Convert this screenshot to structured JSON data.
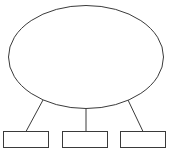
{
  "canvas": {
    "width": 194,
    "height": 151,
    "background_color": "#ffffff"
  },
  "diagram": {
    "type": "hierarchy-tree",
    "title": "",
    "stroke_color": "#3a3a3a",
    "fill_color": "#ffffff",
    "stroke_width": 1,
    "root": {
      "id": "root-ellipse",
      "shape": "ellipse",
      "label": "",
      "cx": 86,
      "cy": 57,
      "rx": 77.5,
      "ry": 51.5
    },
    "children": [
      {
        "id": "child-box-1",
        "shape": "rectangle",
        "label": "",
        "x": 3.5,
        "y": 131.5,
        "width": 45,
        "height": 16
      },
      {
        "id": "child-box-2",
        "shape": "rectangle",
        "label": "",
        "x": 62.5,
        "y": 131.5,
        "width": 45,
        "height": 16
      },
      {
        "id": "child-box-3",
        "shape": "rectangle",
        "label": "",
        "x": 120.5,
        "y": 131.5,
        "width": 45,
        "height": 16
      }
    ],
    "connectors": [
      {
        "id": "connector-left",
        "from": "root-ellipse",
        "to": "child-box-1",
        "x1": 43,
        "y1": 100,
        "x2": 26,
        "y2": 131.5,
        "label": ""
      },
      {
        "id": "connector-center",
        "from": "root-ellipse",
        "to": "child-box-2",
        "x1": 86,
        "y1": 108.5,
        "x2": 86,
        "y2": 131.5,
        "label": ""
      },
      {
        "id": "connector-right",
        "from": "root-ellipse",
        "to": "child-box-3",
        "x1": 128,
        "y1": 100,
        "x2": 143,
        "y2": 131.5,
        "label": ""
      }
    ]
  }
}
